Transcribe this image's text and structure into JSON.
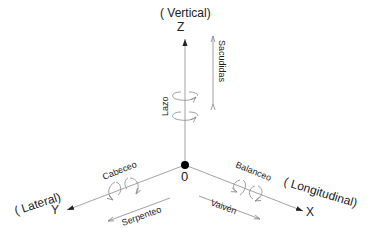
{
  "diagram": {
    "axes": {
      "z": {
        "letter": "Z",
        "name": "( Vertical)"
      },
      "y": {
        "letter": "Y",
        "name": "( Lateral)"
      },
      "x": {
        "letter": "X",
        "name": "( Longitudinal)"
      },
      "origin": "0"
    },
    "motions": {
      "lazo": "Lazo",
      "sacudidas": "Sacudidas",
      "cabeceo": "Cabeceo",
      "serpenteo": "Serpenteo",
      "balanceo": "Balanceo",
      "vaiven": "Vaivén"
    },
    "colors": {
      "axis": "#444444",
      "motion": "#888888",
      "text": "#222222"
    }
  }
}
